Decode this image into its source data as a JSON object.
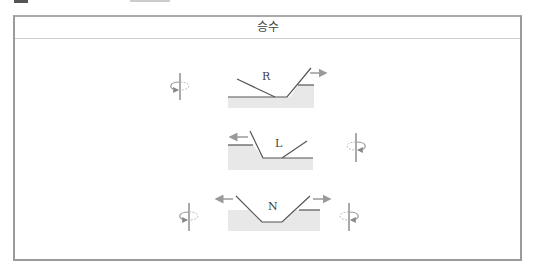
{
  "table": {
    "header": "승수"
  },
  "figures": [
    {
      "label": "R",
      "rotation_arrow": "left",
      "feed_arrow": "right"
    },
    {
      "label": "L",
      "rotation_arrow": "right",
      "feed_arrow": "left"
    },
    {
      "label": "N",
      "rotation_arrows": [
        "left",
        "right"
      ],
      "feed_arrows": [
        "left",
        "right"
      ]
    }
  ],
  "colors": {
    "line": "#555555",
    "fill": "#e6e6e6",
    "arrow": "#999999",
    "border": "#9a9a9a"
  }
}
